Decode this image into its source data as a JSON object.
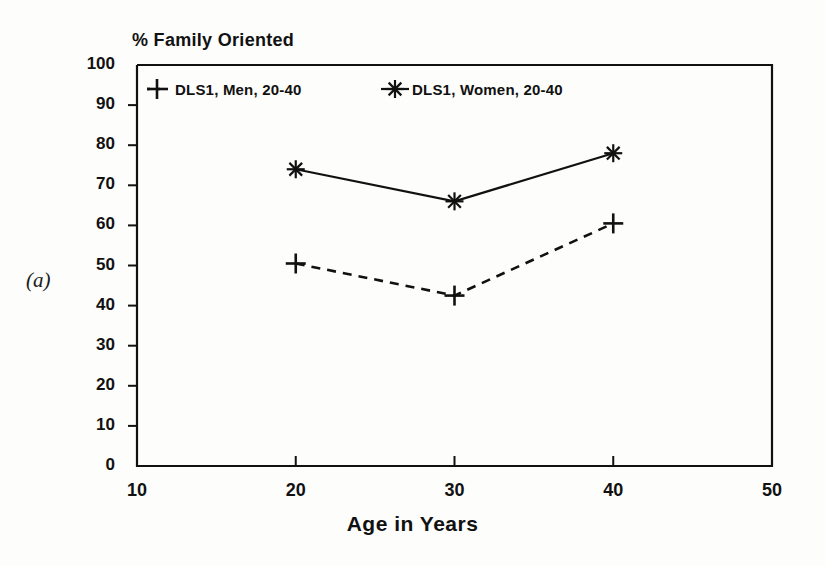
{
  "figure": {
    "panel_label": "(a)",
    "ink_color": "#111111",
    "background_color": "#fdfdfc"
  },
  "chart_data": {
    "type": "line",
    "title": "% Family Oriented",
    "subtitle": "",
    "xlabel": "Age in Years",
    "ylabel": "% Family Oriented",
    "x": [
      20,
      30,
      40
    ],
    "xlim": [
      10,
      50
    ],
    "ylim": [
      0,
      100
    ],
    "xticks": [
      10,
      20,
      30,
      40,
      50
    ],
    "yticks": [
      0,
      10,
      20,
      30,
      40,
      50,
      60,
      70,
      80,
      90,
      100
    ],
    "grid": false,
    "legend_position": "top-left-inside",
    "series": [
      {
        "name": "DLS1, Men, 20-40",
        "values": [
          50.5,
          42.5,
          60.5
        ],
        "marker": "plus",
        "line_style": "dashed",
        "color": "#111111"
      },
      {
        "name": "DLS1, Women, 20-40",
        "values": [
          74,
          66,
          78
        ],
        "marker": "asterisk",
        "line_style": "solid",
        "color": "#111111"
      }
    ]
  }
}
